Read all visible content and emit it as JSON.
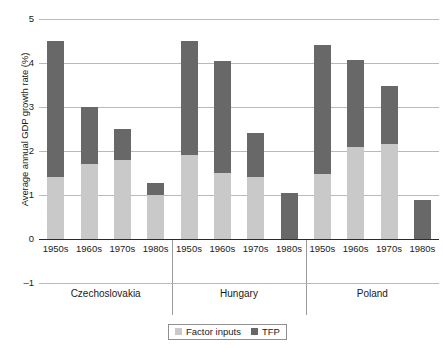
{
  "chart_data": {
    "type": "bar",
    "subtype": "stacked",
    "title": "",
    "xlabel": "",
    "ylabel": "Average annual GDP growth rate (%)",
    "ylim": [
      -1,
      5
    ],
    "yticks": [
      5,
      4,
      3,
      2,
      1,
      0,
      -1
    ],
    "ytick_labels": [
      "5",
      "4",
      "3",
      "2",
      "1",
      "0",
      "–1"
    ],
    "grid": true,
    "grid_axis": "y",
    "legend_position": "bottom-center",
    "categories": [
      "1950s",
      "1960s",
      "1970s",
      "1980s",
      "1950s",
      "1960s",
      "1970s",
      "1980s",
      "1950s",
      "1960s",
      "1970s",
      "1980s"
    ],
    "groups": [
      {
        "label": "Czechoslovakia",
        "categories": [
          "1950s",
          "1960s",
          "1970s",
          "1980s"
        ]
      },
      {
        "label": "Hungary",
        "categories": [
          "1950s",
          "1960s",
          "1970s",
          "1980s"
        ]
      },
      {
        "label": "Poland",
        "categories": [
          "1950s",
          "1960s",
          "1970s",
          "1980s"
        ]
      }
    ],
    "series": [
      {
        "name": "Factor inputs",
        "color": "#c9c9c9",
        "values": [
          1.4,
          1.7,
          1.8,
          1.0,
          1.9,
          1.5,
          1.4,
          0.0,
          1.48,
          2.1,
          2.17,
          0.0
        ]
      },
      {
        "name": "TFP",
        "color": "#686868",
        "values": [
          3.1,
          1.3,
          0.7,
          0.28,
          2.6,
          2.55,
          1.0,
          1.05,
          2.92,
          1.97,
          1.3,
          0.88
        ]
      }
    ],
    "totals": [
      4.5,
      3.0,
      2.5,
      1.28,
      4.5,
      4.05,
      2.4,
      1.05,
      4.4,
      4.07,
      3.47,
      0.88
    ]
  },
  "legend": {
    "items": [
      {
        "label": "Factor inputs",
        "color": "#c9c9c9"
      },
      {
        "label": "TFP",
        "color": "#686868"
      }
    ]
  },
  "axis": {
    "y_title": "Average annual GDP growth rate (%)"
  }
}
